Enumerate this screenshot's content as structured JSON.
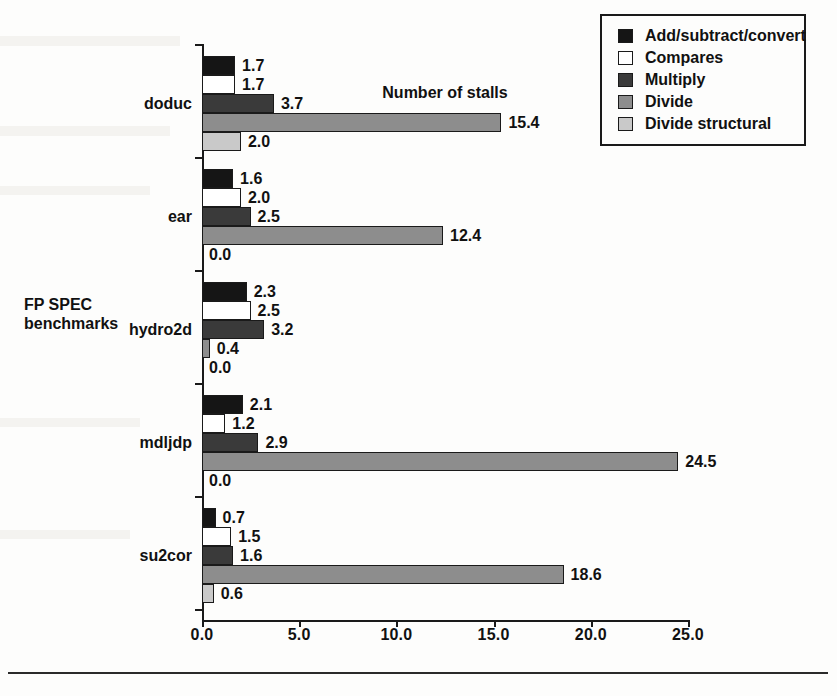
{
  "chart_data": {
    "type": "bar",
    "orientation": "horizontal",
    "title": "",
    "xlabel": "Number of stalls",
    "ylabel": "FP SPEC benchmarks",
    "xlim": [
      0.0,
      25.0
    ],
    "xticks": [
      "0.0",
      "5.0",
      "10.0",
      "15.0",
      "20.0",
      "25.0"
    ],
    "xtick_values": [
      0.0,
      5.0,
      10.0,
      15.0,
      20.0,
      25.0
    ],
    "grid": false,
    "legend_position": "top-right",
    "categories": [
      "doduc",
      "ear",
      "hydro2d",
      "mdljdp",
      "su2cor"
    ],
    "series": [
      {
        "name": "Add/subtract/convert",
        "color": "#151515",
        "values": [
          1.7,
          1.6,
          2.3,
          2.1,
          0.7
        ],
        "labels": [
          "1.7",
          "1.6",
          "2.3",
          "2.1",
          "0.7"
        ]
      },
      {
        "name": "Compares",
        "color": "#ffffff",
        "values": [
          1.7,
          2.0,
          2.5,
          1.2,
          1.5
        ],
        "labels": [
          "1.7",
          "2.0",
          "2.5",
          "1.2",
          "1.5"
        ]
      },
      {
        "name": "Multiply",
        "color": "#3a3a3a",
        "values": [
          3.7,
          2.5,
          3.2,
          2.9,
          1.6
        ],
        "labels": [
          "3.7",
          "2.5",
          "3.2",
          "2.9",
          "1.6"
        ]
      },
      {
        "name": "Divide",
        "color": "#8d8d8d",
        "values": [
          15.4,
          12.4,
          0.4,
          24.5,
          18.6
        ],
        "labels": [
          "15.4",
          "12.4",
          "0.4",
          "24.5",
          "18.6"
        ]
      },
      {
        "name": "Divide structural",
        "color": "#c9c9c9",
        "values": [
          2.0,
          0.0,
          0.0,
          0.0,
          0.6
        ],
        "labels": [
          "2.0",
          "0.0",
          "0.0",
          "0.0",
          "0.6"
        ]
      }
    ]
  },
  "legend": {
    "items": [
      {
        "label": "Add/subtract/convert",
        "swatch": "sw-add"
      },
      {
        "label": "Compares",
        "swatch": "sw-comp"
      },
      {
        "label": "Multiply",
        "swatch": "sw-mult"
      },
      {
        "label": "Divide",
        "swatch": "sw-div"
      },
      {
        "label": "Divide structural",
        "swatch": "sw-divs"
      }
    ]
  },
  "axis": {
    "y_title_line1": "FP SPEC",
    "y_title_line2": "benchmarks",
    "x_title": "Number of stalls"
  }
}
